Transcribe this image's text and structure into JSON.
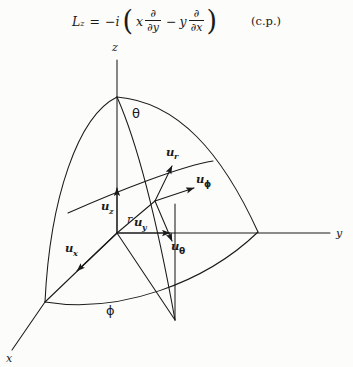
{
  "equation": {
    "lhs_symbol": "L",
    "lhs_subscript": "z",
    "equals": "=",
    "sign": "−i",
    "open_paren": "(",
    "term1_var": "x",
    "term1_num": "∂",
    "term1_den": "∂y",
    "minus": "−",
    "term2_var": "y",
    "term2_num": "∂",
    "term2_den": "∂x",
    "close_paren": ")",
    "note": "(c.p.)"
  },
  "diagram": {
    "type": "spherical-coordinate-axes",
    "axes": [
      {
        "name": "z",
        "label": "z"
      },
      {
        "name": "y",
        "label": "y"
      },
      {
        "name": "x",
        "label": "x"
      }
    ],
    "angles": [
      {
        "name": "theta",
        "label": "θ"
      },
      {
        "name": "phi",
        "label": "ϕ"
      }
    ],
    "radius_label": "r",
    "unit_vectors": [
      {
        "name": "u_r",
        "base": "u",
        "sub": "r",
        "sub_type": "latin"
      },
      {
        "name": "u_phi",
        "base": "u",
        "sub": "ϕ",
        "sub_type": "greek"
      },
      {
        "name": "u_theta",
        "base": "u",
        "sub": "θ",
        "sub_type": "greek"
      },
      {
        "name": "u_z",
        "base": "u",
        "sub": "z",
        "sub_type": "latin"
      },
      {
        "name": "u_y",
        "base": "u",
        "sub": "y",
        "sub_type": "latin"
      },
      {
        "name": "u_x",
        "base": "u",
        "sub": "x",
        "sub_type": "latin"
      }
    ],
    "colors": {
      "ink": "#1a1a1a",
      "background": "#fcfcfb"
    }
  }
}
